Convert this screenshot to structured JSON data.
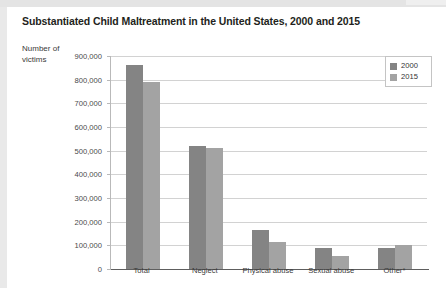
{
  "figure": {
    "title": "Substantiated Child Maltreatment in the United States, 2000 and 2015",
    "ylabel": "Number of\nvictims"
  },
  "chart_data": {
    "type": "bar",
    "title": "Substantiated Child Maltreatment in the United States, 2000 and 2015",
    "xlabel": "",
    "ylabel": "Number of victims",
    "ylim": [
      0,
      900000
    ],
    "ytick_labels": [
      "900,000",
      "800,000",
      "700,000",
      "600,000",
      "500,000",
      "400,000",
      "300,000",
      "200,000",
      "100,000",
      "0"
    ],
    "ytick_values": [
      900000,
      800000,
      700000,
      600000,
      500000,
      400000,
      300000,
      200000,
      100000,
      0
    ],
    "grid": true,
    "legend_position": "top-right",
    "categories": [
      "Total",
      "Neglect",
      "Physical abuse",
      "Sexual abuse",
      "Other*"
    ],
    "series": [
      {
        "name": "2000",
        "color": "#848484",
        "values": [
          862000,
          518000,
          166000,
          88000,
          90000
        ]
      },
      {
        "name": "2015",
        "color": "#a3a3a3",
        "values": [
          790000,
          512000,
          116000,
          57000,
          103000
        ]
      }
    ]
  }
}
